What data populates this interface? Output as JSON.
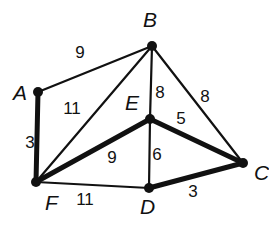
{
  "graph": {
    "nodes": [
      {
        "id": "A",
        "x": 38,
        "y": 92,
        "lx": 13,
        "ly": 100
      },
      {
        "id": "B",
        "x": 152,
        "y": 46,
        "lx": 143,
        "ly": 27
      },
      {
        "id": "E",
        "x": 150,
        "y": 119,
        "lx": 125,
        "ly": 110
      },
      {
        "id": "C",
        "x": 243,
        "y": 163,
        "lx": 254,
        "ly": 180
      },
      {
        "id": "D",
        "x": 149,
        "y": 188,
        "lx": 140,
        "ly": 214
      },
      {
        "id": "F",
        "x": 36,
        "y": 182,
        "lx": 45,
        "ly": 210
      }
    ],
    "edges": [
      {
        "from": "A",
        "to": "B",
        "weight": "9",
        "thick": false,
        "lx": 80,
        "ly": 58
      },
      {
        "from": "A",
        "to": "F",
        "weight": "3",
        "thick": true,
        "lx": 30,
        "ly": 148
      },
      {
        "from": "B",
        "to": "F",
        "weight": "11",
        "thick": false,
        "lx": 72,
        "ly": 114
      },
      {
        "from": "B",
        "to": "E",
        "weight": "8",
        "thick": false,
        "lx": 160,
        "ly": 98
      },
      {
        "from": "B",
        "to": "C",
        "weight": "8",
        "thick": false,
        "lx": 205,
        "ly": 102
      },
      {
        "from": "E",
        "to": "C",
        "weight": "5",
        "thick": false,
        "lx": 181,
        "ly": 124,
        "thick_override": true
      },
      {
        "from": "F",
        "to": "E",
        "weight": "9",
        "thick": true,
        "lx": 112,
        "ly": 163
      },
      {
        "from": "E",
        "to": "D",
        "weight": "6",
        "thick": false,
        "lx": 157,
        "ly": 160
      },
      {
        "from": "F",
        "to": "D",
        "weight": "11",
        "thick": false,
        "lx": 85,
        "ly": 205
      },
      {
        "from": "D",
        "to": "C",
        "weight": "3",
        "thick": true,
        "lx": 193,
        "ly": 197
      }
    ]
  }
}
